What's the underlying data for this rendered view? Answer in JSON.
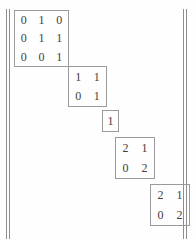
{
  "figure": {
    "caption_fragment": "",
    "delimiter": "double-vertical-bar",
    "layout": "block-diagonal-staircase"
  },
  "matrix": {
    "blocks": [
      {
        "id": "block-1",
        "rows": 3,
        "cols": 3,
        "values": [
          [
            "0",
            "1",
            "0"
          ],
          [
            "0",
            "1",
            "1"
          ],
          [
            "0",
            "0",
            "1"
          ]
        ]
      },
      {
        "id": "block-2",
        "rows": 2,
        "cols": 2,
        "values": [
          [
            "1",
            "1"
          ],
          [
            "0",
            "1"
          ]
        ]
      },
      {
        "id": "block-3",
        "rows": 1,
        "cols": 1,
        "values": [
          [
            "1"
          ]
        ]
      },
      {
        "id": "block-4",
        "rows": 2,
        "cols": 2,
        "values": [
          [
            "2",
            "1"
          ],
          [
            "0",
            "2"
          ]
        ]
      },
      {
        "id": "block-5",
        "rows": 2,
        "cols": 2,
        "values": [
          [
            "2",
            "1"
          ],
          [
            "0",
            "2"
          ]
        ]
      }
    ]
  },
  "colors": {
    "ink": "#3f3f3f",
    "rule": "#9a9a9a",
    "delimiter": "#8e8e8e",
    "page": "#fefefe"
  }
}
